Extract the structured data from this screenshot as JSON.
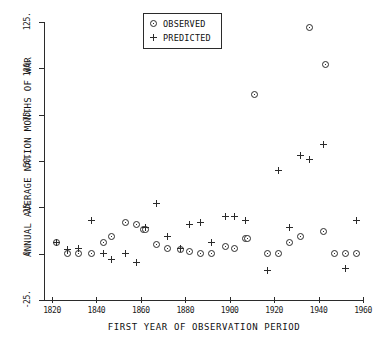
{
  "chart_data": {
    "type": "scatter",
    "title": "",
    "xlabel": "FIRST YEAR OF OBSERVATION PERIOD",
    "ylabel": "ANNUAL AVERAGE NATION MONTHS OF WAR",
    "xlim": [
      1820,
      1960
    ],
    "ylim": [
      -25,
      125
    ],
    "xticks": [
      "1820",
      "1840",
      "1860",
      "1880",
      "1900",
      "1920",
      "1940",
      "1960"
    ],
    "xtick_values": [
      1820,
      1840,
      1860,
      1880,
      1900,
      1920,
      1940,
      1960
    ],
    "yticks": [
      "-25.",
      "0",
      "25.",
      "50.",
      "75.",
      "100.",
      "125."
    ],
    "ytick_values": [
      -25,
      0,
      25,
      50,
      75,
      100,
      125
    ],
    "grid": false,
    "legend_position": "top-center",
    "series": [
      {
        "name": "OBSERVED",
        "marker": "circle-dot",
        "points": [
          {
            "x": 1822,
            "y": 6
          },
          {
            "x": 1827,
            "y": 0
          },
          {
            "x": 1832,
            "y": 0
          },
          {
            "x": 1838,
            "y": 0
          },
          {
            "x": 1843,
            "y": 6
          },
          {
            "x": 1847,
            "y": 9
          },
          {
            "x": 1853,
            "y": 17
          },
          {
            "x": 1858,
            "y": 16
          },
          {
            "x": 1861,
            "y": 13
          },
          {
            "x": 1862,
            "y": 13
          },
          {
            "x": 1867,
            "y": 5
          },
          {
            "x": 1872,
            "y": 3
          },
          {
            "x": 1878,
            "y": 2
          },
          {
            "x": 1882,
            "y": 1
          },
          {
            "x": 1887,
            "y": 0
          },
          {
            "x": 1892,
            "y": 0
          },
          {
            "x": 1898,
            "y": 4
          },
          {
            "x": 1902,
            "y": 3
          },
          {
            "x": 1907,
            "y": 8
          },
          {
            "x": 1908,
            "y": 8
          },
          {
            "x": 1911,
            "y": 86
          },
          {
            "x": 1917,
            "y": 0
          },
          {
            "x": 1922,
            "y": 0
          },
          {
            "x": 1927,
            "y": 6
          },
          {
            "x": 1932,
            "y": 9
          },
          {
            "x": 1936,
            "y": 122
          },
          {
            "x": 1942,
            "y": 12
          },
          {
            "x": 1943,
            "y": 102
          },
          {
            "x": 1947,
            "y": 0
          },
          {
            "x": 1952,
            "y": 0
          },
          {
            "x": 1957,
            "y": 0
          }
        ]
      },
      {
        "name": "PREDICTED",
        "marker": "plus",
        "points": [
          {
            "x": 1822,
            "y": 6
          },
          {
            "x": 1827,
            "y": 2
          },
          {
            "x": 1832,
            "y": 3
          },
          {
            "x": 1838,
            "y": 18
          },
          {
            "x": 1843,
            "y": 0
          },
          {
            "x": 1847,
            "y": -3
          },
          {
            "x": 1853,
            "y": 0
          },
          {
            "x": 1858,
            "y": -5
          },
          {
            "x": 1862,
            "y": 14
          },
          {
            "x": 1867,
            "y": 27
          },
          {
            "x": 1872,
            "y": 9
          },
          {
            "x": 1878,
            "y": 3
          },
          {
            "x": 1882,
            "y": 16
          },
          {
            "x": 1887,
            "y": 17
          },
          {
            "x": 1892,
            "y": 6
          },
          {
            "x": 1898,
            "y": 20
          },
          {
            "x": 1902,
            "y": 20
          },
          {
            "x": 1907,
            "y": 18
          },
          {
            "x": 1917,
            "y": -9
          },
          {
            "x": 1922,
            "y": 45
          },
          {
            "x": 1927,
            "y": 14
          },
          {
            "x": 1932,
            "y": 53
          },
          {
            "x": 1936,
            "y": 51
          },
          {
            "x": 1942,
            "y": 59
          },
          {
            "x": 1952,
            "y": -8
          },
          {
            "x": 1957,
            "y": 18
          }
        ]
      }
    ]
  },
  "legend": {
    "observed_label": "OBSERVED",
    "predicted_label": "PREDICTED"
  },
  "colors": {
    "ink": "#2b2b2b",
    "background": "#ffffff"
  }
}
